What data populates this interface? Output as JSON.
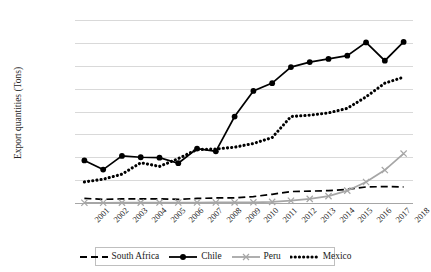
{
  "chart_data": {
    "type": "line",
    "title": "",
    "xlabel": "",
    "ylabel": "Export quantities (Tons)",
    "x": [
      2001,
      2002,
      2003,
      2004,
      2005,
      2006,
      2007,
      2008,
      2009,
      2010,
      2011,
      2012,
      2013,
      2014,
      2015,
      2016,
      2017,
      2018
    ],
    "xtick_labels": [
      "2001",
      "2002",
      "2003",
      "2004",
      "2005",
      "2006",
      "2007",
      "2008",
      "2009",
      "2010",
      "2011",
      "2012",
      "2013",
      "2014",
      "2015",
      "2016",
      "2017",
      "2018"
    ],
    "ytick_labels": [
      "400,000",
      "350,000",
      "300,000",
      "250,000",
      "200,000",
      "150,000",
      "100,000",
      "50,000",
      "0"
    ],
    "ytick_values": [
      400000,
      350000,
      300000,
      250000,
      200000,
      150000,
      100000,
      50000,
      0
    ],
    "ylim": [
      0,
      400000
    ],
    "grid": true,
    "legend_position": "bottom",
    "series": [
      {
        "name": "South Africa",
        "style": "dashed",
        "marker": "none",
        "color": "#000000",
        "values": [
          10000,
          8000,
          9000,
          9000,
          9000,
          8000,
          10000,
          11000,
          11000,
          14000,
          19000,
          25000,
          26000,
          27000,
          30000,
          35000,
          36000,
          35000
        ]
      },
      {
        "name": "Chile",
        "style": "solid",
        "marker": "circle",
        "color": "#000000",
        "values": [
          93000,
          73000,
          103000,
          100000,
          99000,
          87000,
          119000,
          113000,
          189000,
          245000,
          262000,
          297000,
          308000,
          315000,
          322000,
          351000,
          311000,
          352000
        ]
      },
      {
        "name": "Peru",
        "style": "solid",
        "marker": "x",
        "color": "#a6a6a6",
        "values": [
          500,
          600,
          700,
          800,
          900,
          1000,
          1100,
          1200,
          1300,
          1500,
          2500,
          5000,
          9000,
          15000,
          27000,
          46000,
          72000,
          108000
        ]
      },
      {
        "name": "Mexico",
        "style": "dotted",
        "marker": "none",
        "color": "#000000",
        "values": [
          46000,
          52000,
          63000,
          88000,
          80000,
          97000,
          117000,
          118000,
          122000,
          130000,
          143000,
          189000,
          192000,
          197000,
          207000,
          232000,
          262000,
          275000
        ]
      }
    ]
  },
  "legend": {
    "items": [
      {
        "label": "South Africa",
        "swatch": "dashed-line-swatch"
      },
      {
        "label": "Chile",
        "swatch": "solid-circle-line-swatch"
      },
      {
        "label": "Peru",
        "swatch": "gray-x-line-swatch"
      },
      {
        "label": "Mexico",
        "swatch": "dotted-line-swatch"
      }
    ]
  },
  "axes": {
    "y_title": "Export quantities (Tons)"
  }
}
